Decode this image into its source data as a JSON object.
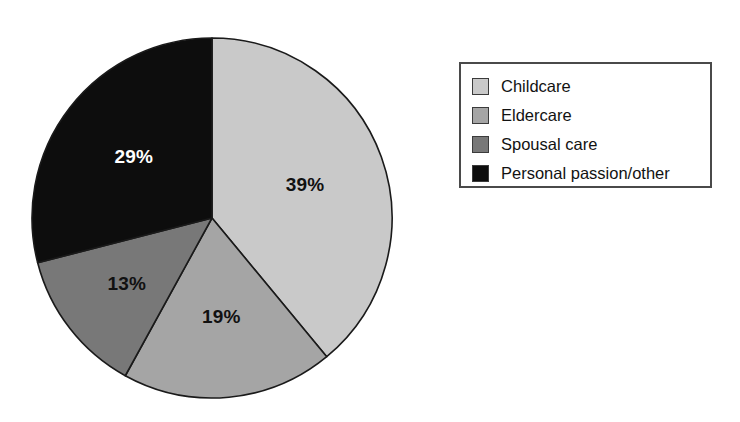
{
  "chart_data": {
    "type": "pie",
    "title": "",
    "subtitle": "",
    "xlabel": "",
    "ylabel": "",
    "grid": false,
    "legend_position": "right",
    "start_angle_deg": 0,
    "direction": "clockwise",
    "categories": [
      "Childcare",
      "Eldercare",
      "Spousal care",
      "Personal passion/other"
    ],
    "values": [
      39,
      19,
      13,
      29
    ],
    "value_unit": "%",
    "data_labels": [
      "39%",
      "19%",
      "13%",
      "29%"
    ],
    "colors": [
      "#c9c9c9",
      "#a5a5a5",
      "#787878",
      "#0d0d0d"
    ],
    "label_text_colors": [
      "#111111",
      "#111111",
      "#111111",
      "#ffffff"
    ],
    "slices": [
      {
        "label": "Childcare",
        "value": 39,
        "data_label": "39%",
        "color": "#c9c9c9",
        "label_color": "#111111"
      },
      {
        "label": "Eldercare",
        "value": 19,
        "data_label": "19%",
        "color": "#a5a5a5",
        "label_color": "#111111"
      },
      {
        "label": "Spousal care",
        "value": 13,
        "data_label": "13%",
        "color": "#787878",
        "label_color": "#111111"
      },
      {
        "label": "Personal passion/other",
        "value": 29,
        "data_label": "29%",
        "color": "#0d0d0d",
        "label_color": "#ffffff"
      }
    ]
  },
  "pie": {
    "center_x": 182,
    "center_y": 182,
    "radius": 180,
    "outline_color": "#1a1a1a"
  },
  "legend": {
    "border_color": "#4a4a4a",
    "background": "#ffffff",
    "items": [
      {
        "label": "Childcare",
        "color": "#c9c9c9"
      },
      {
        "label": "Eldercare",
        "color": "#a5a5a5"
      },
      {
        "label": "Spousal care",
        "color": "#787878"
      },
      {
        "label": "Personal passion/other",
        "color": "#0d0d0d"
      }
    ]
  },
  "page": {
    "background": "#ffffff"
  }
}
